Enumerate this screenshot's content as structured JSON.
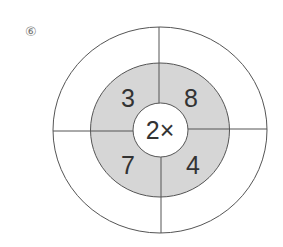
{
  "problem_label": "⑥",
  "diagram": {
    "center_text": "2×",
    "ring_numbers": {
      "top_left": "3",
      "top_right": "8",
      "bottom_left": "7",
      "bottom_right": "4"
    },
    "colors": {
      "ring_fill": "#d6d6d6",
      "line": "#555555",
      "background": "#ffffff"
    }
  }
}
